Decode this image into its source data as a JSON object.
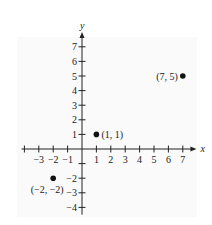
{
  "chart_data": {
    "type": "scatter",
    "title": "",
    "xlabel": "x",
    "ylabel": "y",
    "xlim": [
      -4,
      7.5
    ],
    "ylim": [
      -4,
      7.5
    ],
    "grid": false,
    "x_ticks": [
      -3,
      -2,
      -1,
      1,
      2,
      3,
      4,
      5,
      6,
      7
    ],
    "x_tick_labels": [
      "−3",
      "−2",
      "−1",
      "1",
      "2",
      "3",
      "4",
      "5",
      "6",
      "7"
    ],
    "y_ticks": [
      -4,
      -3,
      -2,
      -1,
      1,
      2,
      3,
      4,
      5,
      6,
      7
    ],
    "y_tick_labels": [
      "−4",
      "−3",
      "−2",
      "",
      "1",
      "2",
      "3",
      "4",
      "5",
      "6",
      "7"
    ],
    "points": [
      {
        "x": 1,
        "y": 1,
        "label": "(1, 1)",
        "label_pos": "right"
      },
      {
        "x": -2,
        "y": -2,
        "label": "(−2, −2)",
        "label_pos": "below"
      },
      {
        "x": 7,
        "y": 5,
        "label": "(7, 5)",
        "label_pos": "left"
      }
    ]
  },
  "colors": {
    "ink": "#222222",
    "panel": "#fafafa"
  }
}
